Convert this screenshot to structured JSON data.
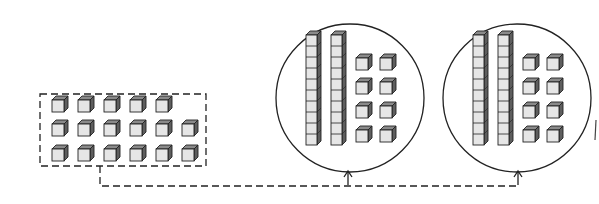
{
  "figure": {
    "loose_group": {
      "rows": [
        5,
        6,
        6
      ],
      "total_units": 17
    },
    "circled_groups": [
      {
        "tens_rods": 2,
        "unit_cubes": 8,
        "value": 28
      },
      {
        "tens_rods": 2,
        "unit_cubes": 8,
        "value": 28
      }
    ],
    "connector": {
      "style": "dashed",
      "arrow_targets": 2
    },
    "colors": {
      "stroke": "#222222",
      "cube_front": "#e6e6e6",
      "cube_top": "#8a8a8a",
      "cube_side": "#5e5e5e",
      "background": "#ffffff"
    }
  }
}
